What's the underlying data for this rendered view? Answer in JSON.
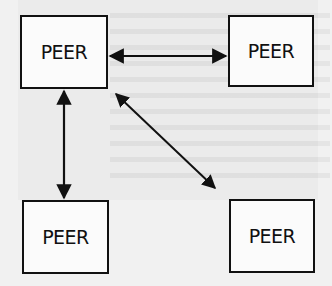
{
  "diagram": {
    "type": "peer-to-peer network",
    "nodes": [
      {
        "id": "top-left",
        "label": "PEER",
        "x": 20,
        "y": 15,
        "w": 88,
        "h": 74
      },
      {
        "id": "top-right",
        "label": "PEER",
        "x": 228,
        "y": 15,
        "w": 86,
        "h": 72
      },
      {
        "id": "bottom-left",
        "label": "PEER",
        "x": 22,
        "y": 200,
        "w": 87,
        "h": 74
      },
      {
        "id": "bottom-right",
        "label": "PEER",
        "x": 229,
        "y": 199,
        "w": 86,
        "h": 74
      }
    ],
    "edges": [
      {
        "from": "top-left",
        "to": "top-right",
        "bidirectional": true
      },
      {
        "from": "top-left",
        "to": "bottom-left",
        "bidirectional": true
      },
      {
        "from": "top-left",
        "to": "bottom-right",
        "bidirectional": true
      }
    ],
    "colors": {
      "line": "#111111",
      "box_fill": "#fbfbfb",
      "background": "#f1f1f1"
    }
  }
}
